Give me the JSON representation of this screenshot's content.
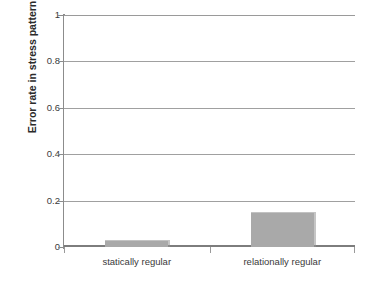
{
  "chart_data": {
    "type": "bar",
    "title": "",
    "xlabel": "",
    "ylabel": "Error rate in stress pattern",
    "categories": [
      "statically regular",
      "relationally regular"
    ],
    "values": [
      0.03,
      0.15
    ],
    "ylim": [
      0,
      1
    ],
    "ytick_labels": [
      "0",
      "0.2",
      "0.4",
      "0.6",
      "0.8",
      "1"
    ],
    "ytick_values": [
      0,
      0.2,
      0.4,
      0.6,
      0.8,
      1
    ],
    "grid": "horizontal",
    "legend": "none",
    "bar_color": "#a9a9a9",
    "axis_color": "#8c8c8c",
    "gridline_color": "#a0a0a0",
    "background": "#ffffff"
  }
}
